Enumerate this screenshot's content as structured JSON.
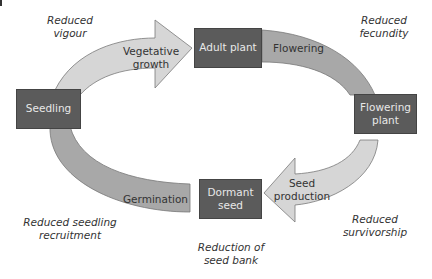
{
  "diagram": {
    "stages": {
      "seedling": "Seedling",
      "adult_plant": "Adult plant",
      "flowering_plant": "Flowering plant",
      "dormant_seed": "Dormant seed"
    },
    "transitions": {
      "vegetative_growth": "Vegetative growth",
      "flowering": "Flowering",
      "seed_production": "Seed production",
      "germination": "Germination"
    },
    "effects": {
      "reduced_vigour": "Reduced vigour",
      "reduced_fecundity": "Reduced fecundity",
      "reduced_survivorship": "Reduced survivorship",
      "reduction_seed_bank": "Reduction of seed bank",
      "reduced_seedling_recruitment": "Reduced seedling recruitment"
    },
    "colors": {
      "box": "#5b5b5b",
      "light_arrow": "#d6d6d6",
      "dark_band": "#a8a8a8"
    }
  }
}
